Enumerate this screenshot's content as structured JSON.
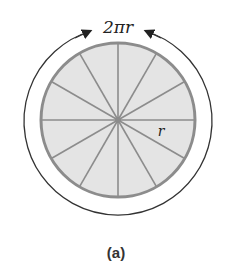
{
  "figure": {
    "circumference_label": "2πr",
    "radius_label": "r",
    "caption": "(a)",
    "sectors": 12,
    "colors": {
      "fill": "#e4e4e4",
      "stroke": "#8c8c8c",
      "arc": "#333333"
    }
  }
}
